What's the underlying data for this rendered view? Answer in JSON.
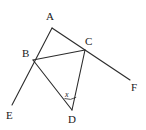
{
  "figure": {
    "type": "geometry-diagram",
    "background_color": "#ffffff",
    "stroke_color": "#2b2b2b",
    "label_color": "#1a1a1a",
    "width": 146,
    "height": 130,
    "points": {
      "A": {
        "label": "A",
        "x": 52,
        "y": 28
      },
      "B": {
        "label": "B",
        "x": 33,
        "y": 60
      },
      "C": {
        "label": "C",
        "x": 85,
        "y": 50
      },
      "D": {
        "label": "D",
        "x": 72,
        "y": 110
      },
      "E": {
        "label": "E",
        "x": 12,
        "y": 105
      },
      "F": {
        "label": "F",
        "x": 130,
        "y": 80
      }
    },
    "segments": [
      {
        "name": "segment-A-E",
        "from": "A",
        "to": "E",
        "through": "B"
      },
      {
        "name": "segment-A-F",
        "from": "A",
        "to": "F",
        "through": "C"
      },
      {
        "name": "segment-B-C",
        "from": "B",
        "to": "C"
      },
      {
        "name": "segment-B-D",
        "from": "B",
        "to": "D"
      },
      {
        "name": "segment-C-D",
        "from": "C",
        "to": "D"
      }
    ],
    "angle_marks": [
      {
        "name": "angle-x-at-D",
        "label": "x",
        "vertex": "D",
        "between": [
          "B",
          "C"
        ]
      }
    ]
  }
}
